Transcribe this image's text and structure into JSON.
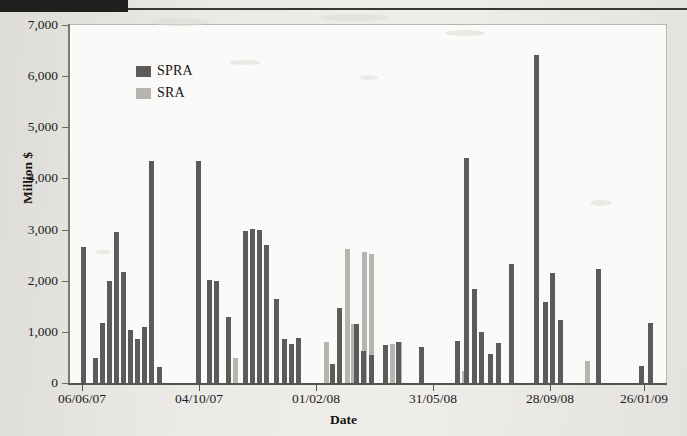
{
  "figure": {
    "background_color": "#ecebe8",
    "plot_background_color": "#fbfaf9"
  },
  "legend": {
    "position": "top-left-inside",
    "items": [
      {
        "label": "SPRA",
        "color": "#5d5b59"
      },
      {
        "label": "SRA",
        "color": "#b6b4b1"
      }
    ]
  },
  "chart_data": {
    "type": "bar",
    "title": "",
    "subtitle": "",
    "xlabel": "Date",
    "ylabel": "Million $",
    "ylim": [
      0,
      7000
    ],
    "ytick_labels": [
      "0",
      "1,000",
      "2,000",
      "3,000",
      "4,000",
      "5,000",
      "6,000",
      "7,000"
    ],
    "ytick_values": [
      0,
      1000,
      2000,
      3000,
      4000,
      5000,
      6000,
      7000
    ],
    "grid": false,
    "xtick_labels": [
      "06/06/07",
      "04/10/07",
      "01/02/08",
      "31/05/08",
      "28/09/08",
      "26/01/09"
    ],
    "xtick_positions_px": [
      82,
      199,
      316,
      433,
      550,
      644
    ],
    "legend_position": "upper left",
    "series": [
      {
        "name": "SPRA",
        "color": "#5d5b59",
        "points": [
          {
            "x_px": 81,
            "value": 2660
          },
          {
            "x_px": 93,
            "value": 480
          },
          {
            "x_px": 100,
            "value": 1180
          },
          {
            "x_px": 107,
            "value": 1990
          },
          {
            "x_px": 114,
            "value": 2960
          },
          {
            "x_px": 121,
            "value": 2180
          },
          {
            "x_px": 128,
            "value": 1040
          },
          {
            "x_px": 135,
            "value": 870
          },
          {
            "x_px": 142,
            "value": 1090
          },
          {
            "x_px": 149,
            "value": 4350
          },
          {
            "x_px": 157,
            "value": 320
          },
          {
            "x_px": 196,
            "value": 4350
          },
          {
            "x_px": 207,
            "value": 2010
          },
          {
            "x_px": 214,
            "value": 2000
          },
          {
            "x_px": 226,
            "value": 1290
          },
          {
            "x_px": 243,
            "value": 2970
          },
          {
            "x_px": 250,
            "value": 3010
          },
          {
            "x_px": 257,
            "value": 2990
          },
          {
            "x_px": 264,
            "value": 2700
          },
          {
            "x_px": 274,
            "value": 1650
          },
          {
            "x_px": 282,
            "value": 870
          },
          {
            "x_px": 289,
            "value": 760
          },
          {
            "x_px": 296,
            "value": 880
          },
          {
            "x_px": 330,
            "value": 370
          },
          {
            "x_px": 337,
            "value": 1460
          },
          {
            "x_px": 354,
            "value": 1150
          },
          {
            "x_px": 361,
            "value": 620
          },
          {
            "x_px": 369,
            "value": 550
          },
          {
            "x_px": 383,
            "value": 740
          },
          {
            "x_px": 396,
            "value": 800
          },
          {
            "x_px": 419,
            "value": 700
          },
          {
            "x_px": 455,
            "value": 830
          },
          {
            "x_px": 464,
            "value": 4390
          },
          {
            "x_px": 472,
            "value": 1830
          },
          {
            "x_px": 479,
            "value": 990
          },
          {
            "x_px": 488,
            "value": 560
          },
          {
            "x_px": 496,
            "value": 790
          },
          {
            "x_px": 509,
            "value": 2330
          },
          {
            "x_px": 534,
            "value": 6420
          },
          {
            "x_px": 543,
            "value": 1580
          },
          {
            "x_px": 550,
            "value": 2150
          },
          {
            "x_px": 558,
            "value": 1230
          },
          {
            "x_px": 596,
            "value": 2230
          },
          {
            "x_px": 639,
            "value": 330
          },
          {
            "x_px": 648,
            "value": 1170
          }
        ]
      },
      {
        "name": "SRA",
        "color": "#b6b4b1",
        "points": [
          {
            "x_px": 233,
            "value": 480
          },
          {
            "x_px": 324,
            "value": 810
          },
          {
            "x_px": 345,
            "value": 2620
          },
          {
            "x_px": 351,
            "value": 1160
          },
          {
            "x_px": 362,
            "value": 2560
          },
          {
            "x_px": 369,
            "value": 2520
          },
          {
            "x_px": 390,
            "value": 770
          },
          {
            "x_px": 397,
            "value": 800
          },
          {
            "x_px": 462,
            "value": 230
          },
          {
            "x_px": 585,
            "value": 440
          }
        ]
      }
    ]
  }
}
